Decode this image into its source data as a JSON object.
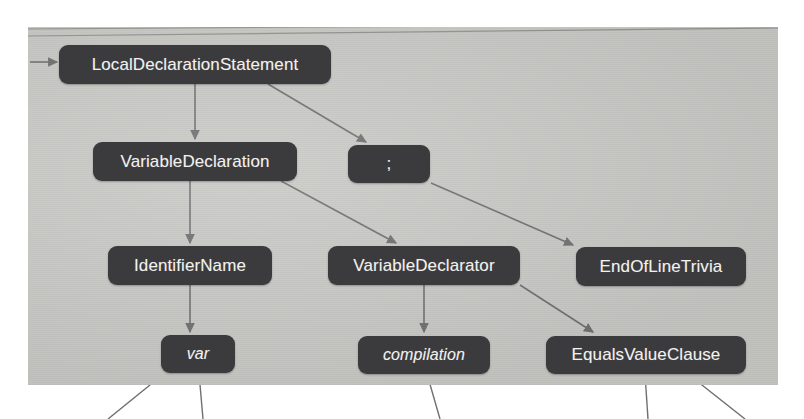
{
  "meta": {
    "view": "syntax-tree-visualizer",
    "background_color": "#ffffff",
    "canvas_color": "#c9cac6",
    "node_color": "#3b3b3d",
    "node_text_color": "#f2f1ee",
    "edge_color": "#6f7070"
  },
  "nodes": [
    {
      "id": "local-declaration-statement",
      "label": "LocalDeclarationStatement",
      "x": 59,
      "y": 45,
      "w": 272,
      "h": 39,
      "font_size": 17,
      "italic": false
    },
    {
      "id": "variable-declaration",
      "label": "VariableDeclaration",
      "x": 93,
      "y": 142,
      "w": 204,
      "h": 39,
      "font_size": 17,
      "italic": false
    },
    {
      "id": "semicolon-token",
      "label": ";",
      "x": 348,
      "y": 145,
      "w": 82,
      "h": 38,
      "font_size": 17,
      "italic": false
    },
    {
      "id": "identifier-name",
      "label": "IdentifierName",
      "x": 108,
      "y": 246,
      "w": 164,
      "h": 39,
      "font_size": 17,
      "italic": false
    },
    {
      "id": "variable-declarator",
      "label": "VariableDeclarator",
      "x": 328,
      "y": 246,
      "w": 192,
      "h": 39,
      "font_size": 17,
      "italic": false
    },
    {
      "id": "end-of-line-trivia",
      "label": "EndOfLineTrivia",
      "x": 576,
      "y": 247,
      "w": 170,
      "h": 39,
      "font_size": 17,
      "italic": false
    },
    {
      "id": "var-token",
      "label": "var",
      "x": 161,
      "y": 335,
      "w": 74,
      "h": 38,
      "font_size": 16,
      "italic": true
    },
    {
      "id": "compilation-token",
      "label": "compilation",
      "x": 358,
      "y": 336,
      "w": 132,
      "h": 38,
      "font_size": 16,
      "italic": true
    },
    {
      "id": "equals-value-clause",
      "label": "EqualsValueClause",
      "x": 546,
      "y": 336,
      "w": 200,
      "h": 38,
      "font_size": 17,
      "italic": false
    }
  ],
  "edges": [
    {
      "id": "edge-root-in",
      "from": "canvas-left-edge",
      "to": "local-declaration-statement",
      "kind": "arrow"
    },
    {
      "id": "edge-lds-vd",
      "from": "local-declaration-statement",
      "to": "variable-declaration",
      "kind": "arrow"
    },
    {
      "id": "edge-lds-semicolon",
      "from": "local-declaration-statement",
      "to": "semicolon-token",
      "kind": "arrow"
    },
    {
      "id": "edge-vd-identifiername",
      "from": "variable-declaration",
      "to": "identifier-name",
      "kind": "arrow"
    },
    {
      "id": "edge-vd-declarator",
      "from": "variable-declaration",
      "to": "variable-declarator",
      "kind": "arrow"
    },
    {
      "id": "edge-semicolon-eol",
      "from": "semicolon-token",
      "to": "end-of-line-trivia",
      "kind": "arrow"
    },
    {
      "id": "edge-identifiername-var",
      "from": "identifier-name",
      "to": "var-token",
      "kind": "arrow"
    },
    {
      "id": "edge-declarator-compilation",
      "from": "variable-declarator",
      "to": "compilation-token",
      "kind": "arrow"
    },
    {
      "id": "edge-declarator-equals",
      "from": "variable-declarator",
      "to": "equals-value-clause",
      "kind": "arrow"
    },
    {
      "id": "edge-var-down-left",
      "from": "var-token",
      "to": "offscreen-below",
      "kind": "line"
    },
    {
      "id": "edge-var-down",
      "from": "var-token",
      "to": "offscreen-below",
      "kind": "line"
    },
    {
      "id": "edge-compilation-down",
      "from": "compilation-token",
      "to": "offscreen-below",
      "kind": "line"
    },
    {
      "id": "edge-equals-down",
      "from": "equals-value-clause",
      "to": "offscreen-below",
      "kind": "line"
    },
    {
      "id": "edge-equals-down-right",
      "from": "equals-value-clause",
      "to": "offscreen-below",
      "kind": "line"
    }
  ]
}
